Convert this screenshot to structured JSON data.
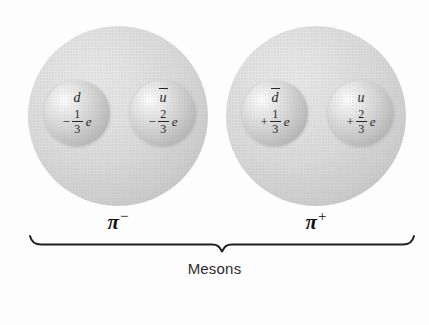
{
  "figure": {
    "caption": "Mesons",
    "background_color": "#fdfdfd",
    "ink_color": "#1c1c1c"
  },
  "mesons": [
    {
      "name": "pi-minus",
      "label_symbol": "π",
      "label_charge": "−",
      "label_full": "π−",
      "quarks": [
        {
          "symbol": "d",
          "antiparticle": false,
          "charge_sign": "−",
          "charge_numerator": "1",
          "charge_denominator": "3",
          "charge_unit": "e",
          "charge_text": "−1/3 e"
        },
        {
          "symbol": "u",
          "antiparticle": true,
          "charge_sign": "−",
          "charge_numerator": "2",
          "charge_denominator": "3",
          "charge_unit": "e",
          "charge_text": "−2/3 e"
        }
      ]
    },
    {
      "name": "pi-plus",
      "label_symbol": "π",
      "label_charge": "+",
      "label_full": "π+",
      "quarks": [
        {
          "symbol": "d",
          "antiparticle": true,
          "charge_sign": "+",
          "charge_numerator": "1",
          "charge_denominator": "3",
          "charge_unit": "e",
          "charge_text": "+1/3 e"
        },
        {
          "symbol": "u",
          "antiparticle": false,
          "charge_sign": "+",
          "charge_numerator": "2",
          "charge_denominator": "3",
          "charge_unit": "e",
          "charge_text": "+2/3 e"
        }
      ]
    }
  ]
}
